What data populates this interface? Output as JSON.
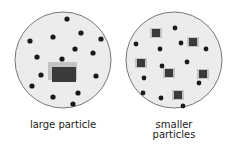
{
  "panels": [
    {
      "label": "large particle"
    },
    {
      "label_line1": "smaller",
      "label_line2": "particles"
    }
  ],
  "colors": {
    "circle_fill": "#ececec",
    "circle_stroke": "#777777",
    "dot": "#1a1a1a",
    "particle": "#3a3a3a",
    "particle_glow": "#9a9a9a"
  }
}
